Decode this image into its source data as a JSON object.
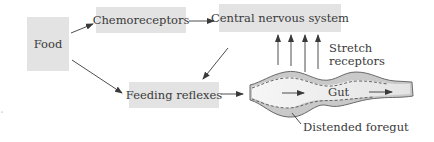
{
  "diagram": {
    "nodes": {
      "food": "Food",
      "chemoreceptors": "Chemoreceptors",
      "cns": "Central nervous system",
      "feeding_reflexes": "Feeding reflexes"
    },
    "labels": {
      "stretch_line1": "Stretch",
      "stretch_line2": "receptors",
      "gut": "Gut",
      "distended_foregut": "Distended foregut"
    },
    "edges": [
      {
        "from": "Food",
        "to": "Chemoreceptors"
      },
      {
        "from": "Food",
        "to": "Feeding reflexes"
      },
      {
        "from": "Chemoreceptors",
        "to": "Central nervous system"
      },
      {
        "from": "Central nervous system",
        "to": "Feeding reflexes"
      },
      {
        "from": "Feeding reflexes",
        "to": "Gut"
      },
      {
        "from": "Stretch receptors (gut)",
        "to": "Central nervous system",
        "count": 4
      }
    ],
    "colors": {
      "box_fill": "#e3e3e3",
      "gut_wall": "#c8c8c8",
      "gut_lumen": "#ececec",
      "line": "#3a3a3a"
    }
  }
}
